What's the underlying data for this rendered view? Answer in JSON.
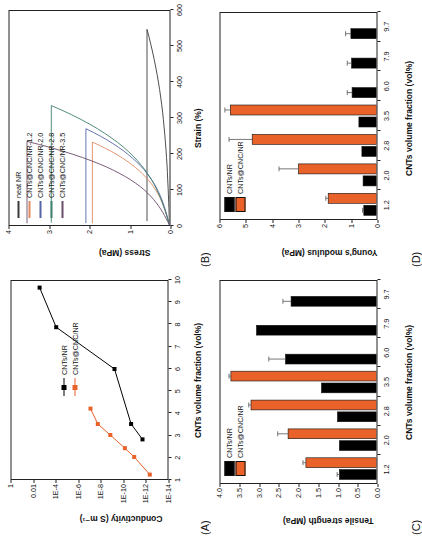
{
  "figure": {
    "panels": [
      "A",
      "B",
      "C",
      "D"
    ],
    "colors": {
      "black": "#000000",
      "orange": "#E8622A",
      "neat_nr": "#3a3a3a",
      "nr_1_2": "#E08A62",
      "nr_2_0": "#5566A8",
      "nr_2_8": "#3E7F6E",
      "nr_3_5": "#6B4E6B"
    }
  },
  "panelA": {
    "label": "(A)",
    "chart_data": {
      "type": "line",
      "title": "",
      "xlabel": "CNTs volume fraction (vol%)",
      "ylabel": "Conductivity (S m⁻¹)",
      "xlim": [
        1,
        10
      ],
      "xticks": [
        "1",
        "2",
        "3",
        "4",
        "5",
        "6",
        "7",
        "8",
        "9",
        "10"
      ],
      "yscale": "log",
      "yticks": [
        "1",
        "0.01",
        "1E-4",
        "1E-6",
        "1E-8",
        "1E-10",
        "1E-12",
        "1E-14"
      ],
      "ylim_exp": [
        -15,
        0
      ],
      "legend_position": "center",
      "series": [
        {
          "name": "CNTs/NR",
          "color": "#000000",
          "marker": "square",
          "x": [
            2.8,
            3.5,
            6.0,
            7.9,
            9.7
          ],
          "y_exp": [
            -12.6,
            -11.5,
            -9.9,
            -4.3,
            -2.7
          ]
        },
        {
          "name": "CNTs@CNC/NR",
          "color": "#E8622A",
          "marker": "square",
          "x": [
            1.2,
            2.0,
            2.4,
            3.0,
            3.5,
            4.2
          ],
          "y_exp": [
            -13.3,
            -11.8,
            -10.9,
            -9.5,
            -8.3,
            -7.6
          ]
        }
      ]
    }
  },
  "panelB": {
    "label": "(B)",
    "chart_data": {
      "type": "line",
      "title": "",
      "xlabel": "Strain (%)",
      "ylabel": "Stress (MPa)",
      "xlim": [
        0,
        640
      ],
      "xticks": [
        "0",
        "100",
        "200",
        "300",
        "400",
        "500",
        "600"
      ],
      "ylim": [
        0,
        4.4
      ],
      "yticks": [
        "0",
        "1",
        "2",
        "3",
        "4"
      ],
      "legend_position": "top-left",
      "series": [
        {
          "name": "neat NR",
          "color": "#3a3a3a",
          "break_strain": 585,
          "break_stress": 0.62
        },
        {
          "name": "CNTs@CNC/NR-1.2",
          "color": "#E08A62",
          "break_strain": 248,
          "break_stress": 2.12
        },
        {
          "name": "CNTs@CNC/NR-2.0",
          "color": "#5566A8",
          "break_strain": 288,
          "break_stress": 2.3
        },
        {
          "name": "CNTs@CNC/NR-2.8",
          "color": "#3E7F6E",
          "break_strain": 357,
          "break_stress": 3.25
        },
        {
          "name": "CNTs@CNC/NR-3.5",
          "color": "#6B4E6B",
          "break_strain": 250,
          "break_stress": 3.92
        }
      ]
    }
  },
  "panelC": {
    "label": "(C)",
    "chart_data": {
      "type": "bar",
      "title": "",
      "xlabel": "CNTs volume fraction (vol%)",
      "ylabel": "Tensile strength (MPa)",
      "categories": [
        "1.2",
        "2.0",
        "2.8",
        "3.5",
        "6.0",
        "7.9",
        "9.7"
      ],
      "ylim": [
        0.0,
        4.2
      ],
      "yticks": [
        "0.0",
        "0.5",
        "1.0",
        "1.5",
        "2.0",
        "2.5",
        "3.0",
        "3.5",
        "4.0"
      ],
      "legend_position": "top-left",
      "series": [
        {
          "name": "CNTs/NR",
          "color": "#000000",
          "values": [
            1.0,
            1.0,
            1.05,
            1.48,
            2.45,
            3.23,
            2.3
          ],
          "errors": [
            0.06,
            0.0,
            0.0,
            0.0,
            0.45,
            0.0,
            0.22
          ]
        },
        {
          "name": "CNTs@CNC/NR",
          "color": "#E8622A",
          "values": [
            1.9,
            2.38,
            3.38,
            3.92,
            null,
            null,
            null
          ],
          "errors": [
            0.08,
            0.28,
            0.06,
            0.05,
            null,
            null,
            null
          ]
        }
      ]
    }
  },
  "panelD": {
    "label": "(D)",
    "chart_data": {
      "type": "bar",
      "title": "",
      "xlabel": "CNTs volume fraction (vol%)",
      "ylabel": "Young's modulus (MPa)",
      "categories": [
        "1.2",
        "2.0",
        "2.8",
        "3.5",
        "6.0",
        "7.9",
        "9.7"
      ],
      "ylim": [
        0,
        6.4
      ],
      "yticks": [
        "0",
        "1",
        "2",
        "3",
        "4",
        "5",
        "6"
      ],
      "legend_position": "top-left",
      "series": [
        {
          "name": "CNTs/NR",
          "color": "#000000",
          "values": [
            0.52,
            0.55,
            0.6,
            0.72,
            1.0,
            1.02,
            1.05
          ],
          "errors": [
            0.05,
            0.0,
            0.0,
            0.0,
            0.2,
            0.18,
            0.22
          ]
        },
        {
          "name": "CNTs@CNC/NR",
          "color": "#E8622A",
          "values": [
            1.98,
            3.2,
            5.1,
            6.0,
            null,
            null,
            null
          ],
          "errors": [
            0.1,
            0.8,
            0.95,
            0.22,
            null,
            null,
            null
          ]
        }
      ]
    }
  }
}
